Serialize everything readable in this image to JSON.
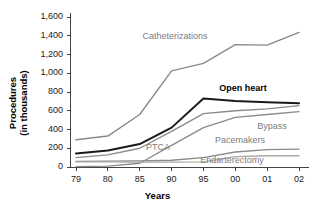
{
  "chart_data": {
    "type": "line",
    "title": "",
    "xlabel": "Years",
    "ylabel": "Procedures\n(in thousands)",
    "ylabel_line1": "Procedures",
    "ylabel_line2": "(in thousands)",
    "categories": [
      "79",
      "80",
      "85",
      "90",
      "95",
      "00",
      "01",
      "02"
    ],
    "ylim": [
      0,
      1600
    ],
    "ytick_values": [
      0,
      200,
      400,
      600,
      800,
      1000,
      1200,
      1400,
      1600
    ],
    "ytick_labels": [
      "0",
      "200",
      "400",
      "600",
      "800",
      "1,000",
      "1,200",
      "1,400",
      "1,600"
    ],
    "grid": false,
    "legend": "inline-labels",
    "series": [
      {
        "name": "Catheterizations",
        "color": "#8a8a8a",
        "width": 1.4,
        "values": [
          290,
          330,
          560,
          1025,
          1105,
          1305,
          1300,
          1435
        ],
        "label_x": 175,
        "label_y": 36
      },
      {
        "name": "Open heart",
        "color": "#1a1a1a",
        "width": 2.0,
        "values": [
          145,
          175,
          245,
          420,
          730,
          705,
          690,
          680
        ],
        "label_x": 243,
        "label_y": 88
      },
      {
        "name": "Bypass",
        "color": "#8a8a8a",
        "width": 1.3,
        "values": [
          100,
          130,
          200,
          380,
          570,
          600,
          620,
          655
        ],
        "label_x": 272,
        "label_y": 126
      },
      {
        "name": "Pacemakers",
        "color": "#8a8a8a",
        "width": 1.3,
        "values": [
          60,
          62,
          66,
          72,
          100,
          160,
          185,
          190
        ],
        "label_x": 240,
        "label_y": 140
      },
      {
        "name": "PTCA",
        "color": "#8a8a8a",
        "width": 1.3,
        "values": [
          5,
          10,
          40,
          230,
          420,
          530,
          560,
          590
        ],
        "label_x": 158,
        "label_y": 147
      },
      {
        "name": "Endarterectomy",
        "color": "#a8a8a8",
        "width": 1.3,
        "values": [
          55,
          55,
          52,
          52,
          55,
          110,
          120,
          120
        ],
        "label_x": 232,
        "label_y": 160
      }
    ]
  },
  "axis": {
    "color": "#444444"
  }
}
